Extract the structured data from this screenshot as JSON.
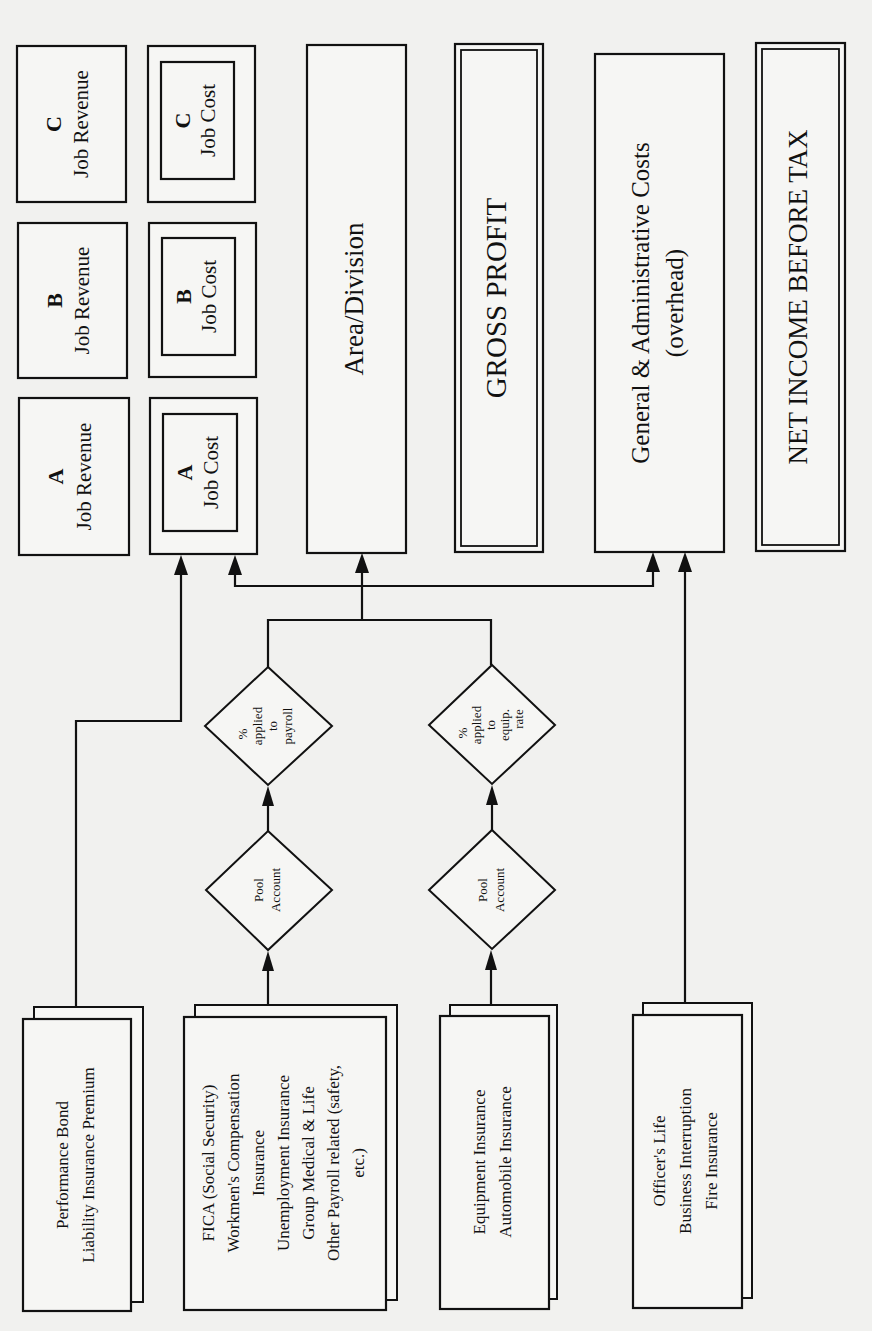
{
  "diagram": {
    "orientation": "rotated-90-ccw",
    "result_boxes": {
      "job_revenue": [
        {
          "letter": "C",
          "label": "Job Revenue"
        },
        {
          "letter": "B",
          "label": "Job Revenue"
        },
        {
          "letter": "A",
          "label": "Job Revenue"
        }
      ],
      "job_cost": [
        {
          "letter": "C",
          "label": "Job Cost"
        },
        {
          "letter": "B",
          "label": "Job Cost"
        },
        {
          "letter": "A",
          "label": "Job Cost"
        }
      ],
      "area_division": "Area/Division",
      "gross_profit": "GROSS PROFIT",
      "ga_costs": {
        "line1": "General & Administrative Costs",
        "line2": "(overhead)"
      },
      "net_income": "NET INCOME BEFORE TAX"
    },
    "allocation_diamonds": {
      "payroll_pct": [
        "%",
        "applied",
        "to",
        "payroll"
      ],
      "equip_pct": [
        "%",
        "applied",
        "to",
        "equip.",
        "rate"
      ],
      "payroll_pool": [
        "Pool",
        "Account"
      ],
      "equip_pool": [
        "Pool",
        "Account"
      ]
    },
    "source_boxes": {
      "performance": [
        "Performance Bond",
        "Liability Insurance Premium"
      ],
      "payroll": [
        "FICA (Social Security)",
        "Workmen's Compensation",
        "Insurance",
        "Unemployment Insurance",
        "Group Medical & Life",
        "Other Payroll related (safety,",
        "etc.)"
      ],
      "equipment": [
        "Equipment Insurance",
        "Automobile Insurance"
      ],
      "officer": [
        "Officer's Life",
        "Business Interruption",
        "Fire Insurance"
      ]
    },
    "colors": {
      "ink": "#111111",
      "paper": "#f1f1ef"
    }
  }
}
